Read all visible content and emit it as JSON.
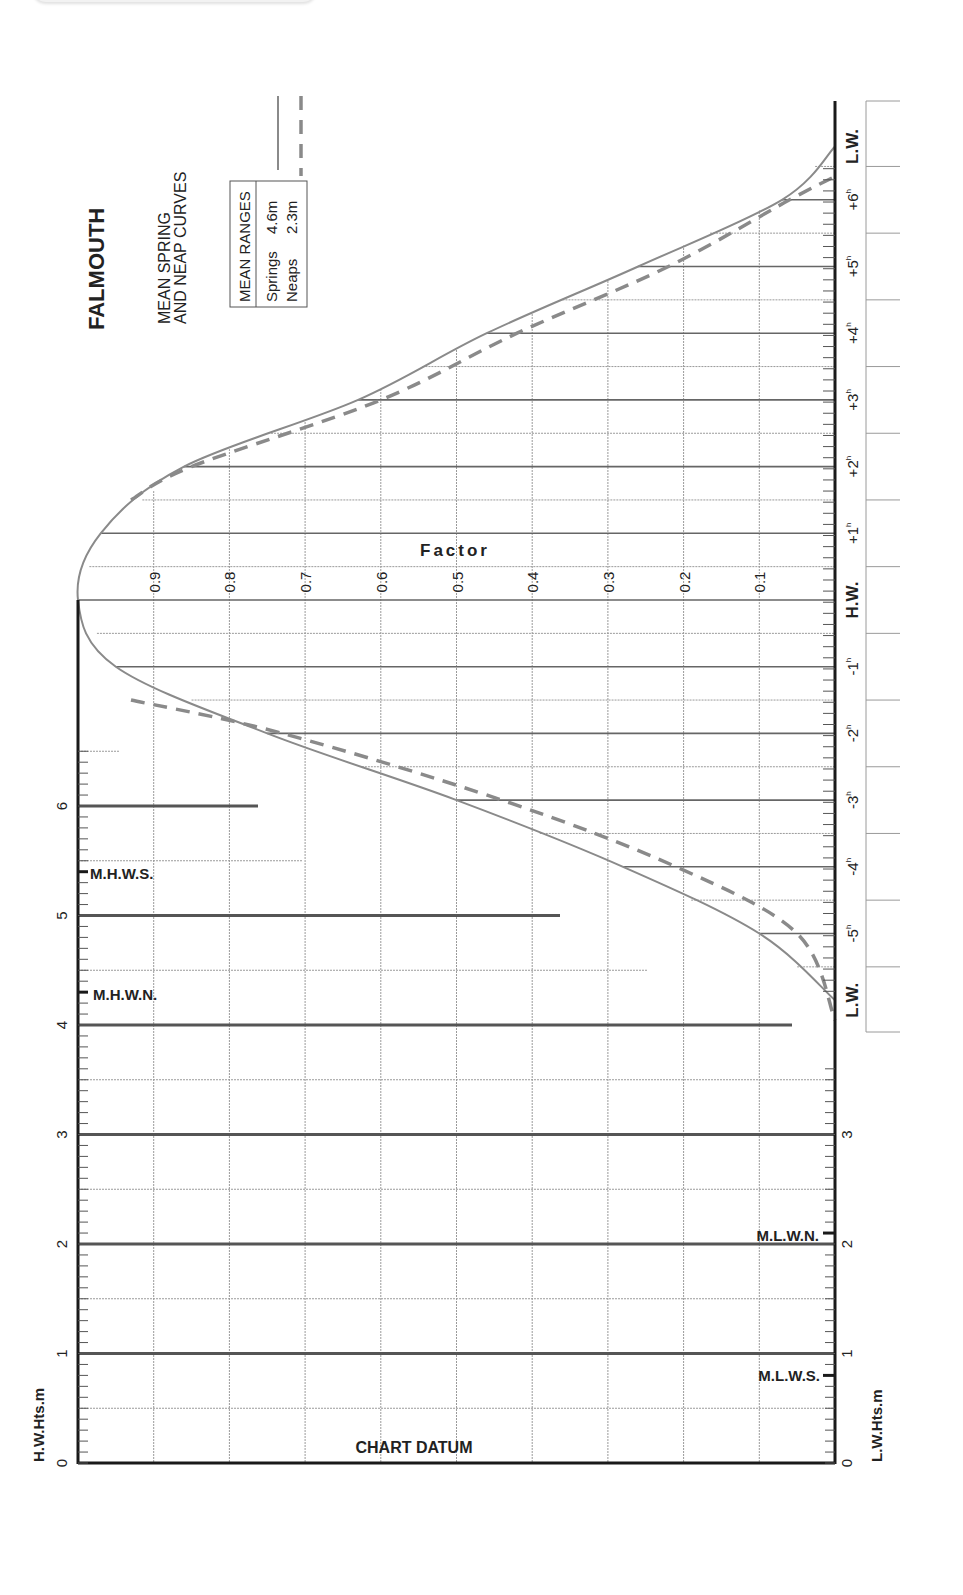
{
  "title": "FALMOUTH",
  "subtitle_line1": "MEAN SPRING",
  "subtitle_line2": "AND NEAP CURVES",
  "legend": {
    "header": "MEAN RANGES",
    "springs_label": "Springs",
    "springs_value": "4.6m",
    "neaps_label": "Neaps",
    "neaps_value": "2.3m"
  },
  "factor_label": "Factor",
  "chart_datum_label": "CHART DATUM",
  "hw_axis_label": "H.W.Hts.m",
  "lw_axis_label": "L.W.Hts.m",
  "levels": {
    "mhws": "M.H.W.S.",
    "mhwn": "M.H.W.N.",
    "mlwn": "M.L.W.N.",
    "mlws": "M.L.W.S."
  },
  "colors": {
    "curve": "#8a8a8a",
    "axis": "#1a1a1a",
    "grid": "#9a9a9a",
    "height_line": "#555555"
  },
  "chart_data": {
    "type": "line",
    "orientation": "rotated 90° (time runs vertically, factor horizontally)",
    "time_axis": {
      "label": "Time relative to H.W. (hours)",
      "ticks": [
        "L.W.",
        "-5h",
        "-4h",
        "-3h",
        "-2h",
        "-1h",
        "H.W.",
        "+1h",
        "+2h",
        "+3h",
        "+4h",
        "+5h",
        "+6h",
        "L.W."
      ]
    },
    "factor_axis": {
      "label": "Factor",
      "ticks": [
        "0.9",
        "0.8",
        "0.7",
        "0.6",
        "0.5",
        "0.4",
        "0.3",
        "0.2",
        "0.1"
      ],
      "range": [
        0,
        1
      ]
    },
    "x": [
      -6.0,
      -5,
      -4,
      -3,
      -2,
      -1,
      0,
      1,
      2,
      3,
      4,
      5,
      6,
      6.8
    ],
    "series": [
      {
        "name": "Springs (4.6m)",
        "style": "solid",
        "values": [
          0.0,
          0.1,
          0.28,
          0.5,
          0.75,
          0.95,
          1.0,
          0.97,
          0.86,
          0.63,
          0.46,
          0.26,
          0.07,
          0.0
        ]
      },
      {
        "name": "Neaps (2.3m)",
        "style": "dashed",
        "values": [
          0.0,
          0.05,
          0.21,
          0.44,
          0.73,
          0.95,
          1.0,
          0.97,
          0.85,
          0.6,
          0.42,
          0.22,
          0.06,
          null
        ]
      }
    ],
    "hw_heights_axis": {
      "label": "H.W.Hts.m",
      "ticks": [
        "0",
        "1",
        "2",
        "3",
        "4",
        "5",
        "6"
      ],
      "range": [
        0,
        6.5
      ],
      "markers": [
        {
          "name": "M.H.W.S.",
          "value": 5.4
        },
        {
          "name": "M.H.W.N.",
          "value": 4.3
        }
      ]
    },
    "lw_heights_axis": {
      "label": "L.W.Hts.m",
      "ticks": [
        "0",
        "1",
        "2",
        "3"
      ],
      "markers": [
        {
          "name": "M.L.W.N.",
          "value": 2.1
        },
        {
          "name": "M.L.W.S.",
          "value": 0.8
        }
      ]
    },
    "mean_ranges": {
      "springs_m": 4.6,
      "neaps_m": 2.3
    },
    "grid": true
  }
}
